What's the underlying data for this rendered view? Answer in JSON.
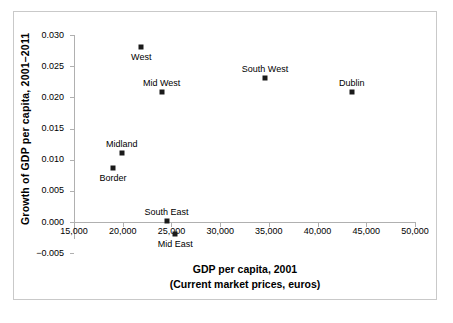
{
  "chart_data": {
    "type": "scatter",
    "title": "",
    "xlabel": "GDP per capita, 2001",
    "xlabel_line2": "(Current market prices, euros)",
    "ylabel": "Growth of GDP per capita, 2001–2011",
    "xlim": [
      15000,
      50000
    ],
    "ylim": [
      -0.005,
      0.03
    ],
    "grid": false,
    "legend": "none",
    "x_ticks": [
      {
        "value": 15000,
        "label": "15,000"
      },
      {
        "value": 20000,
        "label": "20,000"
      },
      {
        "value": 25000,
        "label": "25,000"
      },
      {
        "value": 30000,
        "label": "30,000"
      },
      {
        "value": 35000,
        "label": "35,000"
      },
      {
        "value": 40000,
        "label": "40,000"
      },
      {
        "value": 45000,
        "label": "45,000"
      },
      {
        "value": 50000,
        "label": "50,000"
      }
    ],
    "y_ticks": [
      {
        "value": 0.03,
        "label": "0.030"
      },
      {
        "value": 0.025,
        "label": "0.025"
      },
      {
        "value": 0.02,
        "label": "0.020"
      },
      {
        "value": 0.015,
        "label": "0.015"
      },
      {
        "value": 0.01,
        "label": "0.010"
      },
      {
        "value": 0.005,
        "label": "0.005"
      },
      {
        "value": 0.0,
        "label": "0.000"
      },
      {
        "value": -0.005,
        "label": "−0.005"
      }
    ],
    "points": [
      {
        "name": "West",
        "x": 21900,
        "y": 0.028,
        "label_pos": "below"
      },
      {
        "name": "Mid West",
        "x": 24000,
        "y": 0.0208,
        "label_pos": "above"
      },
      {
        "name": "South West",
        "x": 34600,
        "y": 0.0231,
        "label_pos": "above"
      },
      {
        "name": "Dublin",
        "x": 43500,
        "y": 0.0208,
        "label_pos": "above"
      },
      {
        "name": "Midland",
        "x": 19900,
        "y": 0.0111,
        "label_pos": "above"
      },
      {
        "name": "Border",
        "x": 19000,
        "y": 0.0087,
        "label_pos": "below"
      },
      {
        "name": "South East",
        "x": 24500,
        "y": 0.0001,
        "label_pos": "above"
      },
      {
        "name": "Mid East",
        "x": 25400,
        "y": -0.002,
        "label_pos": "below"
      }
    ],
    "colors": {
      "marker": "#1a1a1a",
      "axis": "#b0b0b0",
      "frame": "#c9c9c9",
      "text": "#000000"
    }
  }
}
